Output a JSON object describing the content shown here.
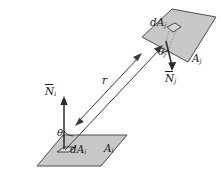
{
  "figure": {
    "colors": {
      "surface_fill": "#c8c8c8",
      "surface_stroke": "#4d4d4d",
      "element_fill": "#d8d8d8",
      "line": "#3a3a3a",
      "text": "#1a1a1a",
      "background": "#ffffff"
    }
  },
  "surfaces": {
    "upper": {
      "area_label": "A",
      "area_sub": "j",
      "element_label": "dA",
      "element_sub": "j",
      "normal_label": "N",
      "normal_sub": "j",
      "angle_label": "θ",
      "angle_sub": "j",
      "normal_direction": "down"
    },
    "lower": {
      "area_label": "A",
      "area_sub": "i",
      "element_label": "dA",
      "element_sub": "i",
      "normal_label": "N",
      "normal_sub": "i",
      "angle_label": "θ",
      "angle_sub": "i",
      "normal_direction": "up"
    }
  },
  "distance": {
    "label": "r",
    "arrow": "double-headed"
  },
  "icons": {
    "upper_surface": "parallelogram-surface-icon",
    "lower_surface": "parallelogram-surface-icon",
    "normal_arrow_up": "arrow-up-icon",
    "normal_arrow_down": "arrow-down-icon",
    "distance_arrow": "double-arrow-icon",
    "ray": "ray-line-icon"
  }
}
